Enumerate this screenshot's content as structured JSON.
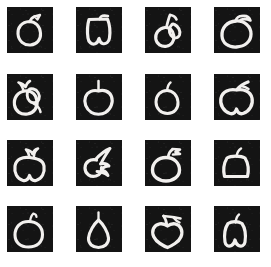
{
  "image": {
    "kind": "sketch-thumbnail-grid",
    "subject": "apple",
    "background_color": "#ffffff",
    "cell_background_color": "#141414",
    "stroke_color": "#f2f0ee",
    "grid": {
      "columns": 4,
      "rows": 4,
      "cell_count": 16
    },
    "cell_size_px": 46,
    "column_x_px": [
      7,
      76,
      145,
      214
    ],
    "row_y_px": [
      7,
      74,
      140,
      206
    ]
  },
  "cells": [
    {
      "index": 1,
      "row": 1,
      "col": 1,
      "label": "apple-sketch-1",
      "description": "round apple outline with short stem and small pointed leaf at top right"
    },
    {
      "index": 2,
      "row": 1,
      "col": 2,
      "label": "apple-sketch-2",
      "description": "squarish apple with flat top, short stem and notched bottom"
    },
    {
      "index": 3,
      "row": 1,
      "col": 3,
      "label": "apple-sketch-3",
      "description": "small apple with tall thick stem and blob leaf on the right"
    },
    {
      "index": 4,
      "row": 1,
      "col": 4,
      "label": "apple-sketch-4",
      "description": "wide apple with curved leaf arcing to the upper right"
    },
    {
      "index": 5,
      "row": 2,
      "col": 1,
      "label": "apple-sketch-5",
      "description": "rough apple with zigzag leaf at top and extra inner contour on the right"
    },
    {
      "index": 6,
      "row": 2,
      "col": 2,
      "label": "apple-sketch-6",
      "description": "clean apple with straight vertical stem and dipped top"
    },
    {
      "index": 7,
      "row": 2,
      "col": 3,
      "label": "apple-sketch-7",
      "description": "small narrow apple with short curved stem"
    },
    {
      "index": 8,
      "row": 2,
      "col": 4,
      "label": "apple-sketch-8",
      "description": "wide apple with thick diagonal leaf pointing up right"
    },
    {
      "index": 9,
      "row": 3,
      "col": 1,
      "label": "apple-sketch-9",
      "description": "apple with leafy zigzag sprig on top"
    },
    {
      "index": 10,
      "row": 3,
      "col": 2,
      "label": "apple-sketch-10",
      "description": "loose abstract scribble, open arc with diagonal stroke"
    },
    {
      "index": 11,
      "row": 3,
      "col": 3,
      "label": "apple-sketch-11",
      "description": "apple with stem and small flag leaf to the right"
    },
    {
      "index": 12,
      "row": 3,
      "col": 4,
      "label": "apple-sketch-12",
      "description": "rounded square apple with simple curved stem"
    },
    {
      "index": 13,
      "row": 4,
      "col": 1,
      "label": "apple-sketch-13",
      "description": "round apple with thin hooked stem"
    },
    {
      "index": 14,
      "row": 4,
      "col": 2,
      "label": "apple-sketch-14",
      "description": "tapered pear shaped fruit with straight stem"
    },
    {
      "index": 15,
      "row": 4,
      "col": 3,
      "label": "apple-sketch-15",
      "description": "heart shaped apple with long branch and leaf to upper right"
    },
    {
      "index": 16,
      "row": 4,
      "col": 4,
      "label": "apple-sketch-16",
      "description": "squarish apple with short curved stem"
    }
  ]
}
